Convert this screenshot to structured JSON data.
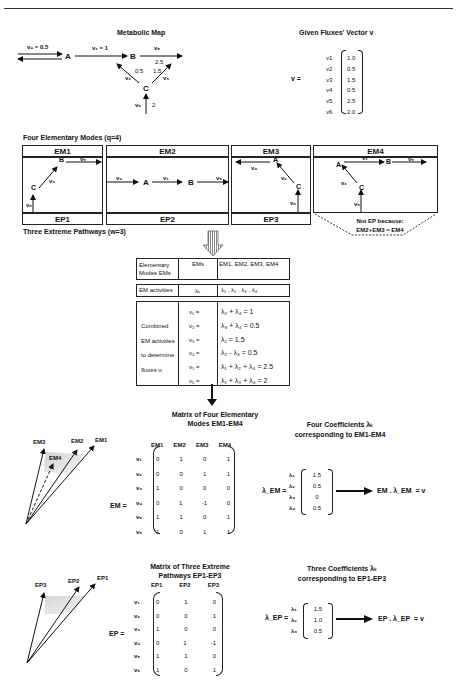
{
  "header": {
    "rule": true
  },
  "metabolic_map": {
    "title": "Metabolic Map",
    "nodes": [
      "A",
      "B",
      "C"
    ],
    "v4_label": "v₄ = 0.5",
    "v1_label": "v₁ = 1",
    "v5_label": "v₅",
    "v5_value": "2.5",
    "v2_label": "v₂",
    "v2_value": "0.5",
    "v3_label": "v₃",
    "v3_value": "1.5",
    "v6_label": "v₆",
    "v6_value": "2"
  },
  "flux_vector": {
    "title": "Given Fluxes' Vector v",
    "lhs": "v =",
    "rows": [
      {
        "name": "v1",
        "value": "1.0"
      },
      {
        "name": "v2",
        "value": "0.5"
      },
      {
        "name": "v3",
        "value": "1.5"
      },
      {
        "name": "v4",
        "value": "0.5"
      },
      {
        "name": "v5",
        "value": "2.5"
      },
      {
        "name": "v6",
        "value": "2.0"
      }
    ]
  },
  "elementary_modes": {
    "title": "Four Elementary Modes (q=4)",
    "modes": [
      {
        "label": "EM1",
        "ep": "EP1"
      },
      {
        "label": "EM2",
        "ep": "EP2"
      },
      {
        "label": "EM3",
        "ep": "EP3"
      },
      {
        "label": "EM4",
        "ep": ""
      }
    ],
    "not_ep_line1": "Not EP because:",
    "not_ep_line2": "EM2+EM3 = EM4",
    "flux_labels": {
      "v1": "v₁",
      "v2": "v₂",
      "v3": "v₃",
      "v4": "v₄",
      "v5": "v₅",
      "v6": "v₆"
    }
  },
  "extreme_pathways": {
    "title": "Three Extreme Pathways (w=3)"
  },
  "activities_table": {
    "row1": {
      "c1": "Elementary Modes EMs",
      "c2": "EMs",
      "c3": "EM1, EM2, EM3, EM4"
    },
    "row2": {
      "c1": "EM activities",
      "c2": "λₖ",
      "c3": "λ₁ , λ₂ , λ₃ , λ₄"
    },
    "side_labels": [
      "Combined",
      "EM activities",
      "to determine",
      "fluxes vᵢ"
    ],
    "equations": [
      {
        "lhs": "v₁ =",
        "rhs": "λ₂ + λ₄ = 1"
      },
      {
        "lhs": "v₂ =",
        "rhs": "λ₃ + λ₄ = 0.5"
      },
      {
        "lhs": "v₃ =",
        "rhs": "λ₁ = 1.5"
      },
      {
        "lhs": "v₄ =",
        "rhs": "λ₂ - λ₃ = 0.5"
      },
      {
        "lhs": "v₅ =",
        "rhs": "λ₁ + λ₂ + λ₄ = 2.5"
      },
      {
        "lhs": "v₆ =",
        "rhs": "λ₁ + λ₃ + λ₄ = 2"
      }
    ]
  },
  "em_matrix": {
    "title_line1": "Matrix of Four Elementary",
    "title_line2": "Modes EM1-EM4",
    "lhs": "EM =",
    "cols": [
      "EM1",
      "EM2",
      "EM3",
      "EM4"
    ],
    "row_labels": [
      "v₁",
      "v₂",
      "v₃",
      "v₄",
      "v₅",
      "v₆"
    ],
    "rows": [
      [
        "0",
        "1",
        "0",
        "1"
      ],
      [
        "0",
        "0",
        "1",
        "1"
      ],
      [
        "1",
        "0",
        "0",
        "0"
      ],
      [
        "0",
        "1",
        "-1",
        "0"
      ],
      [
        "1",
        "1",
        "0",
        "1"
      ],
      [
        "1",
        "0",
        "1",
        "1"
      ]
    ],
    "cone_labels": [
      "EM3",
      "EM4",
      "EM2",
      "EM1"
    ]
  },
  "em_coefficients": {
    "title_line1": "Four Coefficients λₖ",
    "title_line2": "corresponding to EM1-EM4",
    "lhs": "λ_EM =",
    "row_labels": [
      "λ₁",
      "λ₂",
      "λ₃",
      "λ₄"
    ],
    "values": [
      "1.5",
      "0.5",
      "0",
      "0.5"
    ],
    "result": "EM . λ_EM  = v"
  },
  "ep_matrix": {
    "title_line1": "Matrix of Three Extreme",
    "title_line2": "Pathways EP1-EP3",
    "lhs": "EP =",
    "cols": [
      "EP1",
      "EP2",
      "EP3"
    ],
    "row_labels": [
      "v₁",
      "v₂",
      "v₃",
      "v₄",
      "v₅",
      "v₆"
    ],
    "rows": [
      [
        "0",
        "1",
        "0"
      ],
      [
        "0",
        "0",
        "1"
      ],
      [
        "1",
        "0",
        "0"
      ],
      [
        "0",
        "1",
        "-1"
      ],
      [
        "1",
        "1",
        "0"
      ],
      [
        "1",
        "0",
        "1"
      ]
    ],
    "cone_labels": [
      "EP3",
      "EP2",
      "EP1"
    ]
  },
  "ep_coefficients": {
    "title_line1": "Three Coefficients λₖ",
    "title_line2": "corresponding to EP1-EP3",
    "lhs": "λ_EP =",
    "row_labels": [
      "λ₁",
      "λ₂",
      "λ₃"
    ],
    "values": [
      "1.5",
      "1.0",
      "0.5"
    ],
    "result": "EP . λ_EP  = v"
  }
}
